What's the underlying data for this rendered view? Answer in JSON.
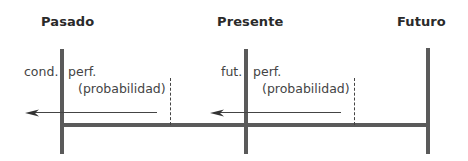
{
  "diagram": {
    "headings": {
      "past": "Pasado",
      "present": "Presente",
      "future": "Futuro"
    },
    "past_segment": {
      "left_label": "cond.",
      "right_label_line1": "perf.",
      "right_label_line2": "(probabilidad)"
    },
    "present_segment": {
      "left_label": "fut.",
      "right_label_line1": "perf.",
      "right_label_line2": "(probabilidad)"
    },
    "colors": {
      "bar": "#5a5a5a",
      "line": "#444444",
      "text": "#3a3a3a"
    }
  }
}
